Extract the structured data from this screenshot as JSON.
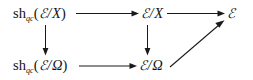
{
  "diagram": {
    "type": "commutative-diagram",
    "background_color": "#ffffff",
    "ink_color": "#1a1a1a",
    "nodes": [
      {
        "id": "sh-qc-e-x",
        "label": "sh_qc(ℰ/X)",
        "op": "sh",
        "subscript": "qc",
        "open_paren": "(",
        "script_e": "ℰ",
        "slash": "/",
        "var": "X",
        "close_paren": ")",
        "position": "top-left"
      },
      {
        "id": "e-x",
        "label": "ℰ/X",
        "script_e": "ℰ",
        "slash": "/",
        "var": "X",
        "position": "top-middle"
      },
      {
        "id": "e-top",
        "label": "ℰ",
        "script_e": "ℰ",
        "position": "top-right"
      },
      {
        "id": "sh-qc-e-omega",
        "label": "sh_qc(ℰ/Ω)",
        "op": "sh",
        "subscript": "qc",
        "open_paren": "(",
        "script_e": "ℰ",
        "slash": "/",
        "var": "Ω",
        "close_paren": ")",
        "position": "bottom-left"
      },
      {
        "id": "e-omega",
        "label": "ℰ/Ω",
        "script_e": "ℰ",
        "slash": "/",
        "var": "Ω",
        "position": "bottom-middle"
      }
    ],
    "arrows": [
      {
        "id": "arrow-top-left-to-middle",
        "from": "sh-qc-e-x",
        "to": "e-x",
        "direction": "right"
      },
      {
        "id": "arrow-top-middle-to-right",
        "from": "e-x",
        "to": "e-top",
        "direction": "right"
      },
      {
        "id": "arrow-left-vertical",
        "from": "sh-qc-e-x",
        "to": "sh-qc-e-omega",
        "direction": "down"
      },
      {
        "id": "arrow-middle-vertical",
        "from": "e-x",
        "to": "e-omega",
        "direction": "down"
      },
      {
        "id": "arrow-bottom-left-to-middle",
        "from": "sh-qc-e-omega",
        "to": "e-omega",
        "direction": "right"
      },
      {
        "id": "arrow-diagonal",
        "from": "e-omega",
        "to": "e-top",
        "direction": "up-right"
      }
    ]
  }
}
